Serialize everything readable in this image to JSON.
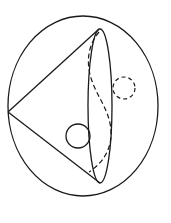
{
  "figure": {
    "stroke_color": "#1a1a1a",
    "background": "#ffffff",
    "outer_sphere": {
      "cx": 83,
      "cy": 106,
      "rx": 75,
      "ry": 90
    },
    "cone": {
      "apex": {
        "x": 8,
        "y": 112
      },
      "base_top": {
        "x": 99,
        "y": 29
      },
      "base_bottom": {
        "x": 100,
        "y": 183
      },
      "base_ellipse": {
        "cx": 100,
        "cy": 106,
        "rx": 12,
        "ry": 77
      }
    },
    "hidden_curve": "M99,32 C88,45 86,62 91,78 C97,98 112,112 111,136 C110,155 98,166 89,172",
    "solid_ball": {
      "cx": 78,
      "cy": 136,
      "r": 12
    },
    "dashed_ball": {
      "cx": 124,
      "cy": 88,
      "r": 11
    }
  }
}
